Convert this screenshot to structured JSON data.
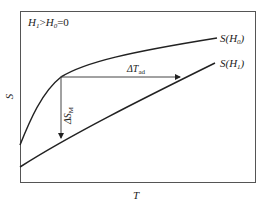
{
  "diagram": {
    "condition_label": {
      "H1": "H",
      "H1_sub": "1",
      "op": ">",
      "H0": "H",
      "H0_sub": "0",
      "eq": "=0"
    },
    "y_axis_label": "S",
    "x_axis_label": "T",
    "curves": [
      {
        "name": "S(H0)",
        "label_main": "S(H",
        "label_sub": "0",
        "label_close": ")"
      },
      {
        "name": "S(H1)",
        "label_main": "S(H",
        "label_sub": "1",
        "label_close": ")"
      }
    ],
    "annotations": {
      "delta_T_main": "ΔT",
      "delta_T_sub": "ad",
      "delta_S_main": "ΔS",
      "delta_S_sub": "M"
    },
    "colors": {
      "line": "#222222",
      "frame": "#555555",
      "background": "#ffffff"
    }
  }
}
